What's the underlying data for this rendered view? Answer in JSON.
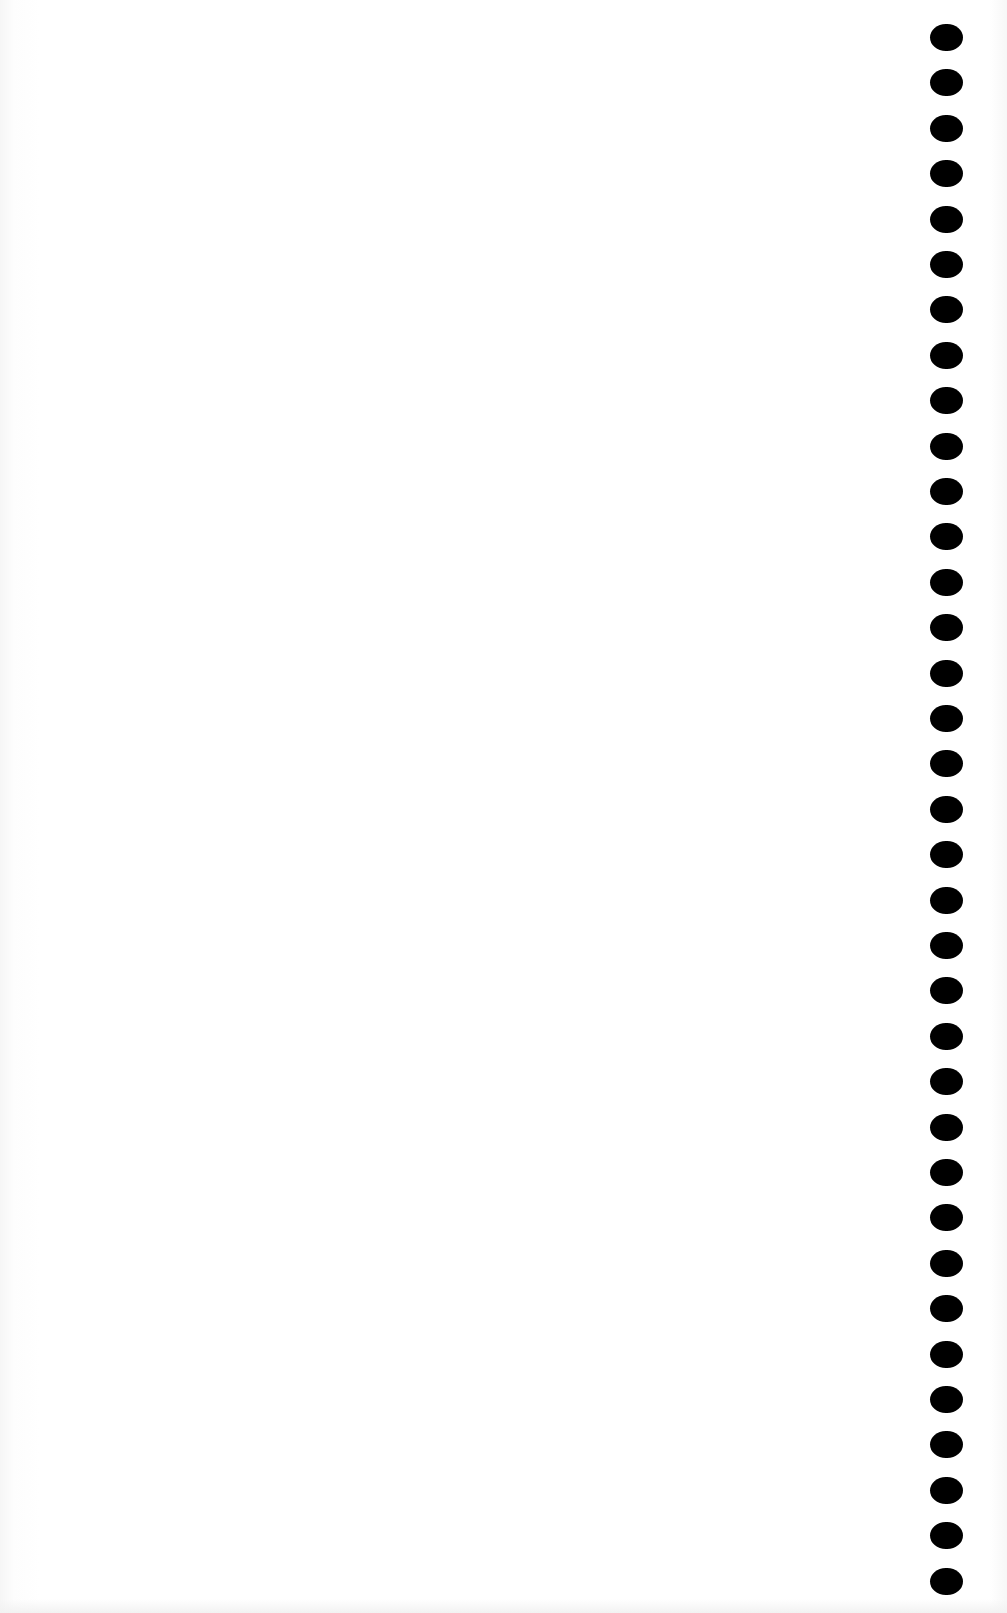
{
  "document": {
    "type": "blank scanned page",
    "text_content": "",
    "background_color": "#ffffff",
    "hole_color": "#000000"
  },
  "binding": {
    "side": "right",
    "hole_count": 35,
    "first_hole_y": 24,
    "hole_spacing": 45.4
  }
}
